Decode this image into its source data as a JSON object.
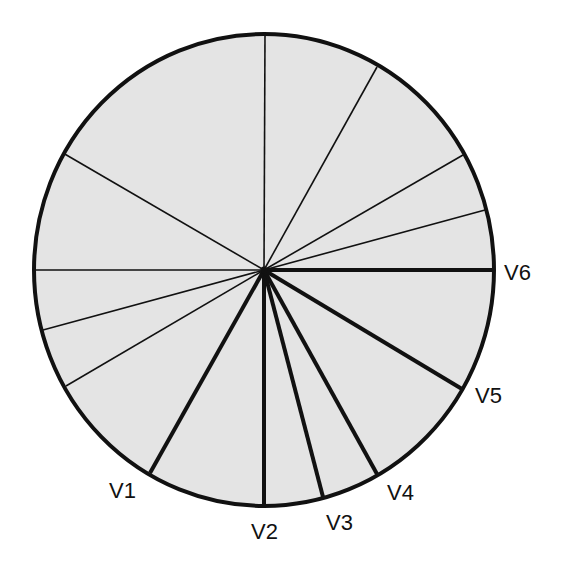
{
  "diagram": {
    "center": {
      "x": 264,
      "y": 270
    },
    "radius": {
      "x": 230,
      "y": 236
    },
    "fill_color": "#e4e4e4",
    "stroke_color": "#111111",
    "thin_spokes": [
      {
        "x": 265,
        "y": 34
      },
      {
        "x": 377,
        "y": 67
      },
      {
        "x": 463,
        "y": 155
      },
      {
        "x": 485,
        "y": 210
      },
      {
        "x": 63,
        "y": 153
      },
      {
        "x": 34,
        "y": 270
      },
      {
        "x": 43,
        "y": 330
      },
      {
        "x": 66,
        "y": 386
      }
    ],
    "labeled_spokes": [
      {
        "label": "V1",
        "end": {
          "x": 150,
          "y": 473
        },
        "label_pos": {
          "x": 109,
          "y": 498
        }
      },
      {
        "label": "V2",
        "end": {
          "x": 264,
          "y": 506
        },
        "label_pos": {
          "x": 251,
          "y": 539
        }
      },
      {
        "label": "V3",
        "end": {
          "x": 323,
          "y": 497
        },
        "label_pos": {
          "x": 326,
          "y": 530
        }
      },
      {
        "label": "V4",
        "end": {
          "x": 377,
          "y": 474
        },
        "label_pos": {
          "x": 387,
          "y": 500
        }
      },
      {
        "label": "V5",
        "end": {
          "x": 462,
          "y": 389
        },
        "label_pos": {
          "x": 475,
          "y": 403
        }
      },
      {
        "label": "V6",
        "end": {
          "x": 494,
          "y": 270
        },
        "label_pos": {
          "x": 504,
          "y": 280
        }
      }
    ]
  }
}
